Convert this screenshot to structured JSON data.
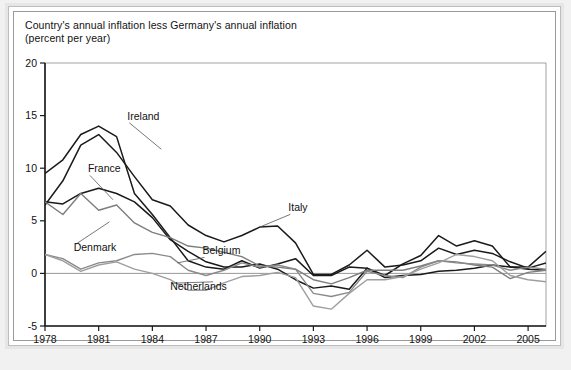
{
  "figure": {
    "title_line1": "Country's annual inflation less Germany's annual inflation",
    "title_line2": "(percent per year)",
    "background_color": "#f1f1f1",
    "frame_color": "#9a9a9a"
  },
  "chart_data": {
    "type": "line",
    "title": "Country's annual inflation less Germany's annual inflation",
    "subtitle": "(percent per year)",
    "xlabel": "",
    "ylabel": "percent per year",
    "xlim": [
      1978,
      2006
    ],
    "ylim": [
      -5,
      20
    ],
    "ytick_values": [
      20,
      15,
      10,
      5,
      0,
      -5
    ],
    "ytick_labels": [
      "20",
      "15",
      "10",
      "5",
      "0",
      "-5"
    ],
    "xtick_values": [
      1978,
      1981,
      1984,
      1987,
      1990,
      1993,
      1996,
      1999,
      2002,
      2005
    ],
    "xtick_labels": [
      "1978",
      "1981",
      "1984",
      "1987",
      "1990",
      "1993",
      "1996",
      "1999",
      "2002",
      "2005"
    ],
    "grid": false,
    "zero_line": true,
    "legend_position": "inline-annotations",
    "x": [
      1978,
      1979,
      1980,
      1981,
      1982,
      1983,
      1984,
      1985,
      1986,
      1987,
      1988,
      1989,
      1990,
      1991,
      1992,
      1993,
      1994,
      1995,
      1996,
      1997,
      1998,
      1999,
      2000,
      2001,
      2002,
      2003,
      2004,
      2005,
      2006
    ],
    "series": [
      {
        "name": "Ireland",
        "color": "#1a1a1a",
        "width": 1.5,
        "label_x": 1982.6,
        "label_y": 14.6,
        "values": [
          9.5,
          10.8,
          13.2,
          14.0,
          13.0,
          7.6,
          5.6,
          3.4,
          1.2,
          0.6,
          0.4,
          1.2,
          0.5,
          0.9,
          1.4,
          -0.2,
          -0.2,
          0.6,
          0.5,
          -0.2,
          0.9,
          1.7,
          3.6,
          2.6,
          3.1,
          2.6,
          0.6,
          0.6,
          2.1
        ]
      },
      {
        "name": "France",
        "color": "#1a1a1a",
        "width": 1.5,
        "label_x": 1980.4,
        "label_y": 9.6,
        "values": [
          6.8,
          6.6,
          7.6,
          8.1,
          7.6,
          6.8,
          5.3,
          3.2,
          2.1,
          1.1,
          0.6,
          0.6,
          0.9,
          0.4,
          -0.6,
          -1.4,
          -1.2,
          -1.5,
          0.5,
          -0.4,
          -0.2,
          -0.1,
          0.2,
          0.3,
          0.5,
          0.8,
          0.6,
          0.4,
          0.3
        ]
      },
      {
        "name": "Italy",
        "color": "#1a1a1a",
        "width": 1.5,
        "label_x": 1991.6,
        "label_y": 5.9,
        "values": [
          6.5,
          8.8,
          12.2,
          13.2,
          11.5,
          9.2,
          7.0,
          6.4,
          4.6,
          3.6,
          3.0,
          3.6,
          4.4,
          4.5,
          2.9,
          -0.1,
          -0.1,
          0.8,
          2.2,
          0.6,
          0.8,
          1.2,
          2.4,
          1.8,
          2.2,
          1.9,
          1.1,
          0.5,
          1.0
        ]
      },
      {
        "name": "Denmark",
        "color": "#7d7d7d",
        "width": 1.4,
        "label_x": 1979.6,
        "label_y": 2.1,
        "values": [
          6.8,
          5.6,
          7.6,
          6.0,
          6.5,
          4.8,
          3.9,
          3.4,
          2.6,
          2.4,
          2.0,
          1.6,
          0.7,
          0.6,
          0.4,
          -0.6,
          -1.0,
          -0.4,
          0.3,
          0.3,
          0.3,
          0.7,
          1.2,
          1.1,
          0.8,
          0.6,
          -0.5,
          0.1,
          0.3
        ]
      },
      {
        "name": "Belgium",
        "color": "#8a8a8a",
        "width": 1.4,
        "label_x": 1986.8,
        "label_y": 1.8,
        "values": [
          1.8,
          1.4,
          0.4,
          1.0,
          1.2,
          1.8,
          1.9,
          1.6,
          0.3,
          -0.2,
          0.3,
          1.0,
          0.6,
          0.8,
          0.4,
          -1.9,
          -2.2,
          -1.8,
          0.2,
          -0.2,
          -0.4,
          0.6,
          1.2,
          1.0,
          0.9,
          0.8,
          0.3,
          0.6,
          0.4
        ]
      },
      {
        "name": "Netherlands",
        "color": "#9e9e9e",
        "width": 1.4,
        "label_x": 1985.0,
        "label_y": -1.6,
        "values": [
          1.8,
          1.2,
          0.2,
          0.8,
          1.1,
          0.4,
          0.0,
          -0.6,
          -1.6,
          -1.6,
          -0.9,
          -0.3,
          -0.2,
          0.1,
          -0.4,
          -3.1,
          -3.4,
          -1.9,
          -0.6,
          -0.6,
          -0.3,
          0.4,
          1.0,
          1.8,
          1.6,
          1.2,
          -0.2,
          -0.6,
          -0.8
        ]
      }
    ],
    "annotations": [
      {
        "text": "Ireland",
        "x": 1982.6,
        "y": 14.6,
        "leader_to_x": 1984.5,
        "leader_to_y": 11.8
      },
      {
        "text": "France",
        "x": 1980.4,
        "y": 9.6,
        "leader_to_x": 1981.8,
        "leader_to_y": 7.0
      },
      {
        "text": "Italy",
        "x": 1991.6,
        "y": 5.9,
        "leader_to_x": 1990.0,
        "leader_to_y": 4.4
      },
      {
        "text": "Denmark",
        "x": 1979.6,
        "y": 2.1,
        "leader_to_x": 1981.6,
        "leader_to_y": 4.9
      },
      {
        "text": "Belgium",
        "x": 1986.8,
        "y": 1.8,
        "leader_to_x": 1985.4,
        "leader_to_y": 1.0
      },
      {
        "text": "Netherlands",
        "x": 1985.0,
        "y": -1.6,
        "leader_to_x": 1987.4,
        "leader_to_y": -0.8
      }
    ]
  }
}
